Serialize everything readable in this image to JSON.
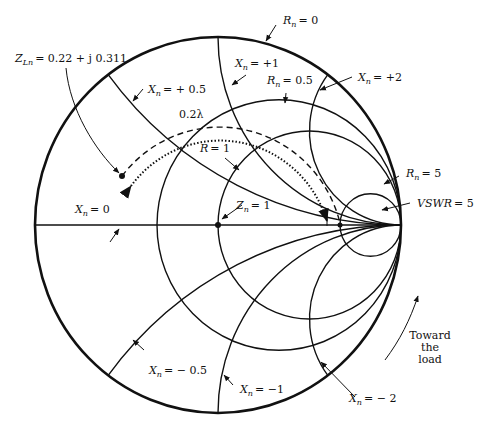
{
  "diagram": {
    "type": "smith-chart",
    "center_label": "Z_n = 1",
    "load_impedance": {
      "var": "Z",
      "sub": "Ln",
      "value": "= 0.22 + j 0.311"
    },
    "distance_label": "0.2λ",
    "direction_label": [
      "Toward",
      "the",
      "load"
    ],
    "labels": {
      "rn0": {
        "var": "R",
        "sub": "n",
        "value": "= 0"
      },
      "xp1": {
        "var": "X",
        "sub": "n",
        "value": "= +1"
      },
      "rn05": {
        "var": "R",
        "sub": "n",
        "value": "= 0.5"
      },
      "xp2": {
        "var": "X",
        "sub": "n",
        "value": "= +2"
      },
      "xp05": {
        "var": "X",
        "sub": "n",
        "value": "= + 0.5"
      },
      "r1": {
        "var": "R",
        "value": "= 1"
      },
      "rn5": {
        "var": "R",
        "sub": "n",
        "value": "= 5"
      },
      "vswr": {
        "var": "VSWR",
        "value": "= 5"
      },
      "x0": {
        "var": "X",
        "sub": "n",
        "value": "= 0"
      },
      "zn1": {
        "var": "Z",
        "sub": "n",
        "value": "= 1"
      },
      "xm05": {
        "var": "X",
        "sub": "n",
        "value": "= − 0.5"
      },
      "xm1": {
        "var": "X",
        "sub": "n",
        "value": "= −1"
      },
      "xm2": {
        "var": "X",
        "sub": "n",
        "value": "= − 2"
      }
    },
    "resistance_circles": [
      0,
      0.5,
      1,
      5
    ],
    "reactance_arcs": [
      0.5,
      1,
      2,
      -0.5,
      -1,
      -2,
      0
    ],
    "vswr": 5,
    "colors": {
      "ink": "#111111",
      "background": "#ffffff"
    }
  }
}
